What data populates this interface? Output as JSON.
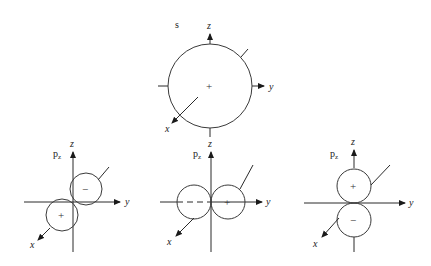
{
  "diagram": {
    "panels": [
      {
        "id": "s",
        "label": "s",
        "axes": {
          "z": "z",
          "y": "y",
          "x": "x"
        },
        "lobes": [
          {
            "sign": "+"
          }
        ]
      },
      {
        "id": "p-left",
        "label": "p",
        "label_sub": "z",
        "axes": {
          "z": "z",
          "y": "y",
          "x": "x"
        },
        "lobes": [
          {
            "sign": "−"
          },
          {
            "sign": "+"
          }
        ]
      },
      {
        "id": "p-middle",
        "label": "p",
        "label_sub": "z",
        "axes": {
          "z": "z",
          "y": "y",
          "x": "x"
        },
        "lobes": [
          {
            "sign": ""
          },
          {
            "sign": "+"
          }
        ]
      },
      {
        "id": "p-right",
        "label": "p",
        "label_sub": "z",
        "axes": {
          "z": "z",
          "y": "y",
          "x": "x"
        },
        "lobes": [
          {
            "sign": "+"
          },
          {
            "sign": "−"
          }
        ]
      }
    ]
  }
}
